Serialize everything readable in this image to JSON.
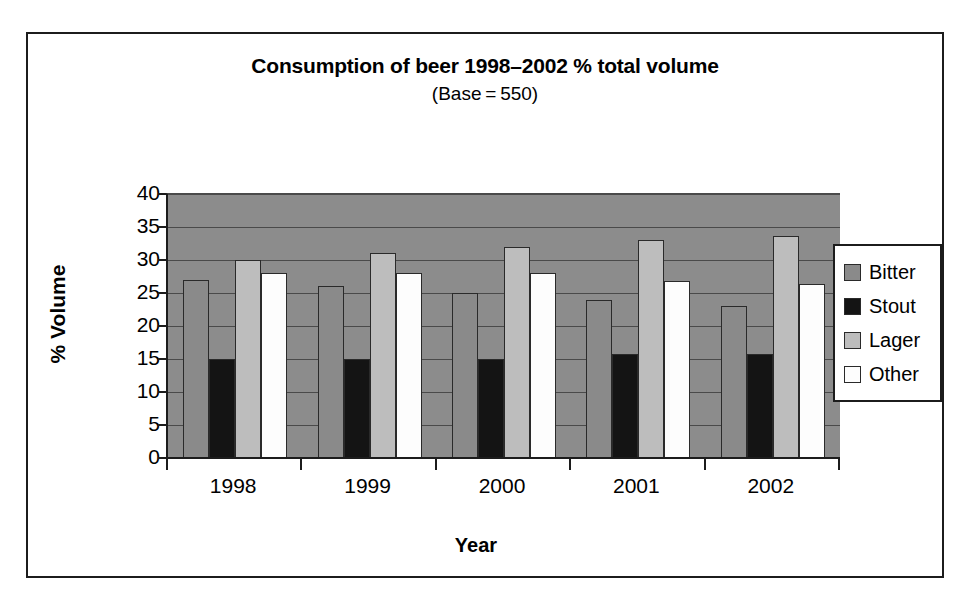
{
  "chart_data": {
    "type": "bar",
    "title": "Consumption of beer 1998–2002 % total volume",
    "subtitle": "(Base = 550)",
    "xlabel": "Year",
    "ylabel": "% Volume",
    "categories": [
      "1998",
      "1999",
      "2000",
      "2001",
      "2002"
    ],
    "yticks": [
      "0",
      "5",
      "10",
      "15",
      "20",
      "25",
      "30",
      "35",
      "40"
    ],
    "ylim": [
      0,
      40
    ],
    "grid": true,
    "legend_position": "right",
    "series": [
      {
        "name": "Bitter",
        "color": "#8a8a8a",
        "values": [
          27,
          26,
          25,
          24,
          23
        ]
      },
      {
        "name": "Stout",
        "color": "#141414",
        "values": [
          15,
          15,
          15,
          15.7,
          15.7
        ]
      },
      {
        "name": "Lager",
        "color": "#bdbdbd",
        "values": [
          30,
          31,
          32,
          33,
          33.6
        ]
      },
      {
        "name": "Other",
        "color": "#fdfdfd",
        "values": [
          28,
          28,
          28,
          26.8,
          26.4
        ]
      }
    ]
  },
  "legend": {
    "items": [
      {
        "label": "Bitter",
        "color": "#8a8a8a"
      },
      {
        "label": "Stout",
        "color": "#141414"
      },
      {
        "label": "Lager",
        "color": "#bdbdbd"
      },
      {
        "label": "Other",
        "color": "#fdfdfd"
      }
    ]
  },
  "colors": {
    "plot_background": "#8c8c8c",
    "figure_background": "#ffffff",
    "axis": "#1c1c1c",
    "gridline": "#4a4a4a"
  }
}
